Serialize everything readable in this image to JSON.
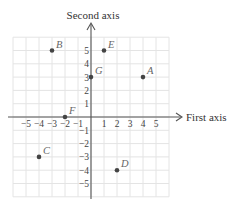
{
  "diagram": {
    "type": "cartesian-plane",
    "x_axis_title": "First axis",
    "y_axis_title": "Second axis",
    "x_ticks": [
      -5,
      -4,
      -3,
      -2,
      -1,
      1,
      2,
      3,
      4,
      5
    ],
    "y_ticks": [
      5,
      4,
      3,
      2,
      1,
      -1,
      -2,
      -3,
      -4,
      -5
    ],
    "grid_range": {
      "x": [
        -6,
        6
      ],
      "y": [
        -6,
        6
      ]
    },
    "grid": true,
    "points": [
      {
        "label": "A",
        "x": 4,
        "y": 3
      },
      {
        "label": "B",
        "x": -3,
        "y": 5
      },
      {
        "label": "C",
        "x": -4,
        "y": -3
      },
      {
        "label": "D",
        "x": 2,
        "y": -4
      },
      {
        "label": "E",
        "x": 1,
        "y": 5
      },
      {
        "label": "F",
        "x": -2,
        "y": 0
      },
      {
        "label": "G",
        "x": 0,
        "y": 3
      }
    ],
    "colors": {
      "grid": "#e4e4e4",
      "axis": "#555555",
      "point": "#444444",
      "point_label": "#666666"
    }
  }
}
